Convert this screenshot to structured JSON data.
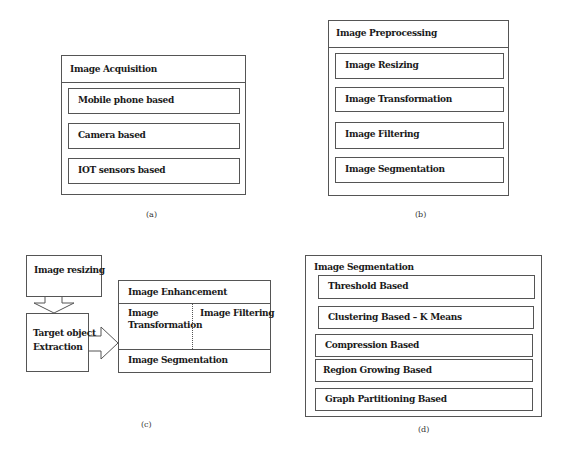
{
  "panel_a": {
    "caption": "(a)",
    "title": "Image Acquisition",
    "items": [
      "Mobile phone based",
      "Camera based",
      "IOT sensors based"
    ]
  },
  "panel_b": {
    "caption": "(b)",
    "title": "Image Preprocessing",
    "items": [
      "Image Resizing",
      "Image Transformation",
      "Image Filtering",
      "Image Segmentation"
    ]
  },
  "panel_c": {
    "caption": "(c)",
    "step1": "Image resizing",
    "step2_line1": "Target object",
    "step2_line2": "Extraction",
    "block": {
      "top": "Image Enhancement",
      "mid_left_line1": "Image",
      "mid_left_line2": "Transformation",
      "mid_right": "Image Filtering",
      "bottom": "Image Segmentation"
    }
  },
  "panel_d": {
    "caption": "(d)",
    "title": "Image Segmentation",
    "items": [
      "Threshold Based",
      "Clustering Based – K Means",
      "Compression Based",
      "Region Growing Based",
      "Graph Partitioning Based"
    ]
  }
}
